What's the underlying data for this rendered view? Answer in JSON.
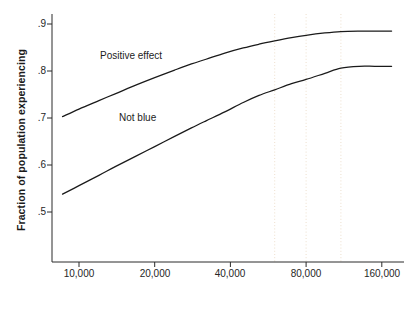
{
  "chart_data": {
    "type": "line",
    "title": "",
    "subtitle": "",
    "xlabel": "Annual income",
    "ylabel": "Fraction of population experiencing",
    "xscale": "log2",
    "xlim": [
      8000,
      180000
    ],
    "ylim": [
      0.44,
      0.915
    ],
    "xticks": [
      10000,
      20000,
      40000,
      80000,
      160000
    ],
    "xticklabels": [
      "10,000",
      "20,000",
      "40,000",
      "80,000",
      "160,000"
    ],
    "yticks": [
      0.5,
      0.6,
      0.7,
      0.8,
      0.9
    ],
    "yticklabels": [
      ".5",
      ".6",
      ".7",
      ".8",
      ".9"
    ],
    "grid": "faint vertical dotted gridlines only",
    "gridlines_x": [
      60000,
      80000,
      110000
    ],
    "legend_position": "inline labels next to curves",
    "line_color": "#1a1a1a",
    "series": [
      {
        "name": "Positive effect",
        "label_x": 18000,
        "label_y": 0.828,
        "x": [
          8600,
          10000,
          12000,
          14000,
          17000,
          20000,
          24000,
          28000,
          32000,
          38000,
          45000,
          52000,
          60000,
          70000,
          80000,
          95000,
          110000,
          130000,
          150000,
          175000
        ],
        "y": [
          0.703,
          0.719,
          0.737,
          0.752,
          0.771,
          0.786,
          0.802,
          0.815,
          0.825,
          0.838,
          0.849,
          0.857,
          0.864,
          0.871,
          0.876,
          0.881,
          0.884,
          0.885,
          0.885,
          0.885
        ]
      },
      {
        "name": "Not blue",
        "label_x": 19000,
        "label_y": 0.705,
        "x": [
          8600,
          10000,
          12000,
          14000,
          17000,
          20000,
          24000,
          28000,
          32000,
          38000,
          45000,
          52000,
          60000,
          70000,
          80000,
          95000,
          110000,
          130000,
          150000,
          175000
        ],
        "y": [
          0.538,
          0.556,
          0.578,
          0.597,
          0.62,
          0.639,
          0.661,
          0.679,
          0.694,
          0.713,
          0.733,
          0.748,
          0.76,
          0.773,
          0.782,
          0.795,
          0.806,
          0.81,
          0.81,
          0.81
        ]
      }
    ]
  },
  "axes": {
    "ylabel": "Fraction of population experiencing",
    "xlabel": "Annual income",
    "yticklabels": [
      ".9",
      ".8",
      ".7",
      ".6",
      ".5"
    ],
    "xticklabels": [
      "10,000",
      "20,000",
      "40,000",
      "80,000",
      "160,000"
    ]
  },
  "series_labels": {
    "top": "Positive effect",
    "bottom": "Not blue"
  }
}
